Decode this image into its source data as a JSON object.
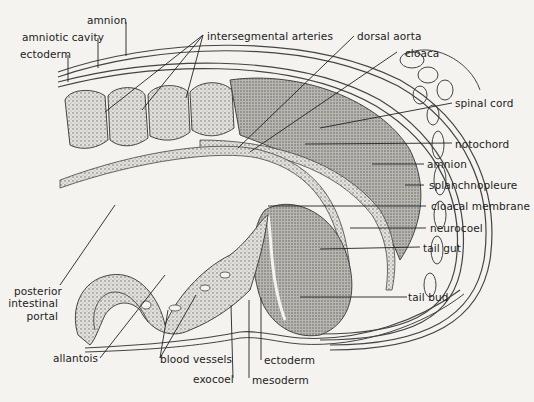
{
  "diagram": {
    "colors": {
      "background": "#f4f3ef",
      "ink": "#222222",
      "tissue_fill": "#cfcfca",
      "dense_fill": "#a9a9a4"
    },
    "labels": {
      "amnion_top": "amnion",
      "amniotic_cavity": "amniotic cavity",
      "ectoderm_top": "ectoderm",
      "intersegmental_arteries": "intersegmental arteries",
      "dorsal_aorta": "dorsal aorta",
      "cloaca": "cloaca",
      "spinal_cord": "spinal cord",
      "notochord": "notochord",
      "amnion_right": "amnion",
      "splanchnopleure": "splanchnopleure",
      "cloacal_membrane": "cloacal membrane",
      "neurocoel": "neurocoel",
      "tail_gut": "tail gut",
      "tail_bud": "tail bud",
      "posterior_intestinal_portal_1": "posterior",
      "posterior_intestinal_portal_2": "intestinal",
      "posterior_intestinal_portal_3": "portal",
      "allantois": "allantois",
      "blood_vessels": "blood vessels",
      "exocoel": "exocoel",
      "ectoderm_bottom": "ectoderm",
      "mesoderm": "mesoderm"
    }
  }
}
